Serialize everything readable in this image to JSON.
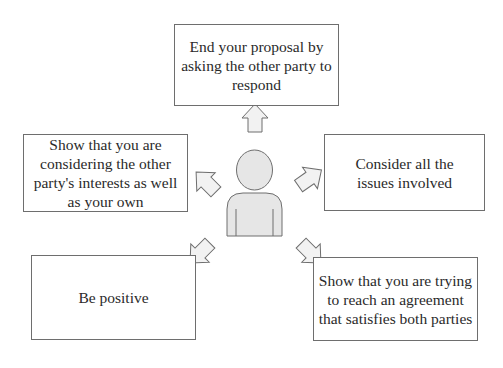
{
  "diagram": {
    "center": {
      "label": "person",
      "icon": "person-icon"
    },
    "boxes": {
      "top": {
        "text": "End your proposal by asking the other party to respond"
      },
      "left": {
        "text": "Show that you are considering the other party's interests as well as your own"
      },
      "right": {
        "text": "Consider all the issues involved"
      },
      "bottom_left": {
        "text": "Be positive"
      },
      "bottom_right": {
        "text": "Show that you are trying to reach an agreement that satisfies both parties"
      }
    },
    "colors": {
      "border": "#6e6e6e",
      "person_fill": "#e6e6e6",
      "arrow_fill": "#f2f2f2",
      "text": "#2a2a2a"
    }
  }
}
